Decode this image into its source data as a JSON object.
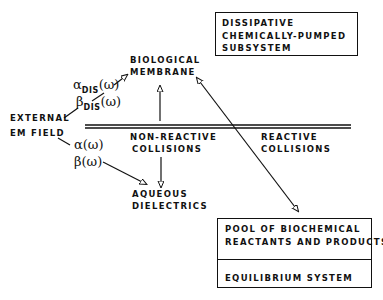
{
  "diagram": {
    "top_box": {
      "lines": [
        "DISSIPATIVE",
        "CHEMICALLY-PUMPED",
        "SUBSYSTEM"
      ]
    },
    "bottom_box": {
      "upper_lines": [
        "POOL OF BIOCHEMICAL",
        "REACTANTS AND PRODUCTS"
      ],
      "lower_lines": [
        "EQUILIBRIUM SYSTEM"
      ]
    },
    "nodes": {
      "biological_membrane": [
        "BIOLOGICAL",
        "MEMBRANE"
      ],
      "external_field": [
        "EXTERNAL",
        "EM FIELD"
      ],
      "aqueous_dielectrics": [
        "AQUEOUS",
        "DIELECTRICS"
      ]
    },
    "regions": {
      "non_reactive": [
        "NON-REACTIVE",
        "COLLISIONS"
      ],
      "reactive": [
        "REACTIVE",
        "COLLISIONS"
      ]
    },
    "coefficients": {
      "alpha_dis": {
        "symbol": "α",
        "sub": "DIS",
        "arg": "(ω)"
      },
      "beta_dis": {
        "symbol": "β",
        "sub": "DIS",
        "arg": "(ω)"
      },
      "alpha": {
        "symbol": "α",
        "arg": "(ω)"
      },
      "beta": {
        "symbol": "β",
        "arg": "(ω)"
      }
    },
    "line_color": "#111111"
  }
}
